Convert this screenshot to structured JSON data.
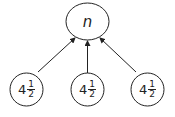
{
  "diagram": {
    "type": "tree",
    "stroke_color": "#222222",
    "root": {
      "label": "n"
    },
    "children": [
      {
        "whole": "4",
        "numerator": "1",
        "denominator": "2"
      },
      {
        "whole": "4",
        "numerator": "1",
        "denominator": "2"
      },
      {
        "whole": "4",
        "numerator": "1",
        "denominator": "2"
      }
    ],
    "edges": [
      {
        "from": "child-0",
        "to": "root",
        "arrow": "head-at-root"
      },
      {
        "from": "child-1",
        "to": "root",
        "arrow": "head-at-root"
      },
      {
        "from": "child-2",
        "to": "root",
        "arrow": "head-at-root"
      }
    ]
  }
}
